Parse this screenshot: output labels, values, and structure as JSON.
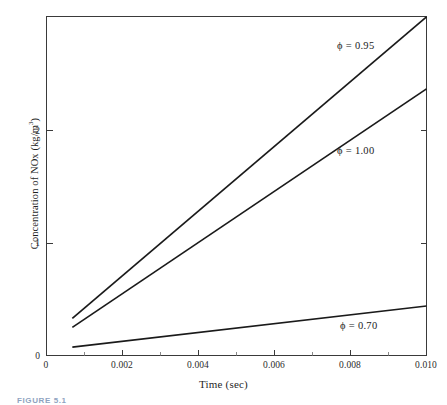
{
  "figure": {
    "caption": "FIGURE 5.1"
  },
  "chart_data": {
    "type": "line",
    "title": "",
    "xlabel": "Time (sec)",
    "ylabel": "Concentration of NOx (kg/m3)",
    "ylabel_base": "Concentration of NOx (kg/m",
    "ylabel_exponent": "3",
    "ylabel_tail": ")",
    "xlim": [
      0,
      0.01
    ],
    "ylim": [
      0,
      3.01
    ],
    "grid": false,
    "legend": "inline-annotations",
    "x_ticks": [
      0,
      0.002,
      0.004,
      0.006,
      0.008,
      0.01
    ],
    "x_tick_labels": [
      "0",
      "0.002",
      "0.004",
      "0.006",
      "0.008",
      "0.010"
    ],
    "x_minor_ticks": [
      0.001,
      0.003,
      0.005,
      0.007,
      0.009
    ],
    "y_ticks": [
      0,
      1,
      2
    ],
    "y_tick_labels": [
      "0",
      "1",
      "2"
    ],
    "y_minor_ticks": [],
    "series": [
      {
        "name": "phi = 0.95",
        "label": "ϕ = 0.95",
        "color": "#1a1a1a",
        "x": [
          0.00068,
          0.01
        ],
        "values": [
          0.33,
          3.01
        ]
      },
      {
        "name": "phi = 1.00",
        "label": "ϕ = 1.00",
        "color": "#1a1a1a",
        "x": [
          0.00068,
          0.01
        ],
        "values": [
          0.25,
          2.37
        ]
      },
      {
        "name": "phi = 0.70",
        "label": "ϕ = 0.70",
        "color": "#1a1a1a",
        "x": [
          0.00068,
          0.01
        ],
        "values": [
          0.075,
          0.44
        ]
      }
    ],
    "annotations": [
      {
        "text": "ϕ = 0.95",
        "x_px": 337,
        "y_px": 40
      },
      {
        "text": "ϕ = 1.00",
        "x_px": 337,
        "y_px": 145
      },
      {
        "text": "ϕ = 0.70",
        "x_px": 340,
        "y_px": 320
      }
    ]
  }
}
